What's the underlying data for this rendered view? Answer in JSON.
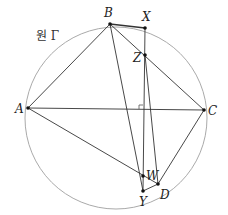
{
  "diagram": {
    "circle": {
      "label": "원 Γ",
      "cx": 116,
      "cy": 118,
      "r": 91,
      "stroke": "#aaaaaa"
    },
    "points": {
      "A": {
        "label": "A",
        "x": 28,
        "y": 108
      },
      "B": {
        "label": "B",
        "x": 110,
        "y": 24
      },
      "C": {
        "label": "C",
        "x": 204,
        "y": 110
      },
      "D": {
        "label": "D",
        "x": 158,
        "y": 184
      },
      "X": {
        "label": "X",
        "x": 145,
        "y": 28
      },
      "Y": {
        "label": "Y",
        "x": 143,
        "y": 191
      },
      "Z": {
        "label": "Z",
        "x": 145,
        "y": 55
      },
      "W": {
        "label": "W",
        "x": 143,
        "y": 176
      }
    },
    "segments": [
      [
        "A",
        "B"
      ],
      [
        "B",
        "C"
      ],
      [
        "C",
        "D"
      ],
      [
        "A",
        "C"
      ],
      [
        "A",
        "D"
      ],
      [
        "B",
        "Y"
      ],
      [
        "X",
        "Y"
      ],
      [
        "Z",
        "D"
      ],
      [
        "B",
        "X"
      ],
      [
        "Y",
        "D"
      ]
    ],
    "right_angle_mark": {
      "at": "intersection of XY and AC"
    },
    "line_color": "#333333"
  }
}
